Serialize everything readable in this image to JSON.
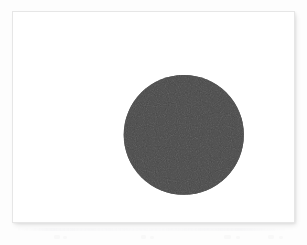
{
  "figure": {
    "title": "",
    "caption": "",
    "background_color": "#fdfdfd",
    "panel": {
      "background_color": "#ffffff",
      "border_color": "#e6e6e6",
      "x": 12,
      "y": 11,
      "width": 283,
      "height": 212
    }
  },
  "chart_data": {
    "type": "scatter",
    "title": "",
    "subtitle": "",
    "xlabel": "",
    "ylabel": "",
    "xlim": [
      0,
      283
    ],
    "ylim": [
      0,
      212
    ],
    "grid": false,
    "legend": [],
    "legend_position": "none",
    "annotations": [],
    "tick_labels": {
      "x": [],
      "y": []
    },
    "axes_visible": false,
    "series": [
      {
        "name": "filled-circle",
        "marker": "circle",
        "filled": true,
        "color": "#4a4a4a",
        "edge_color": "#4a4a4a",
        "points": [
          {
            "x": 172,
            "y": 124,
            "radius": 60.5
          }
        ]
      }
    ]
  },
  "shapes": {
    "circle": {
      "name": "solid-dark-circle",
      "center_x_px": 184,
      "center_y_px": 135,
      "radius_px": 60.5,
      "diameter_px": 121,
      "fill_color": "#4a4a4a",
      "stroke_color": "#474747",
      "stroke_width_px": 0
    }
  },
  "artifacts": {
    "scan_ghost_visible": true,
    "scan_ghost_color": "#f3f3f5"
  }
}
